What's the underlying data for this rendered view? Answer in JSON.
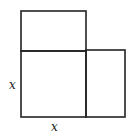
{
  "diagram": {
    "type": "geometry-area-model",
    "shapes": [
      {
        "name": "top-rectangle",
        "x": 21,
        "y": 11,
        "w": 65,
        "h": 40
      },
      {
        "name": "center-square",
        "x": 21,
        "y": 51,
        "w": 65,
        "h": 66
      },
      {
        "name": "right-rectangle",
        "x": 86,
        "y": 50,
        "w": 39,
        "h": 67
      }
    ],
    "labels": {
      "side_left": "x",
      "side_bottom": "x"
    },
    "stroke_color": "#222222"
  }
}
